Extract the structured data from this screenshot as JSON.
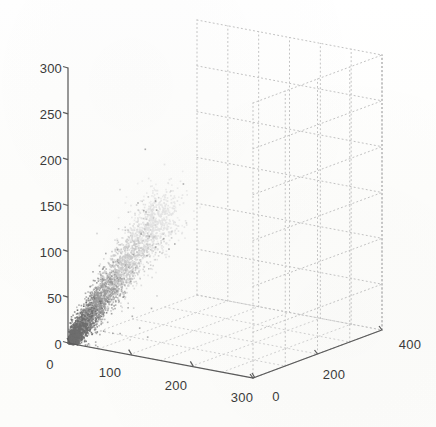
{
  "figure": {
    "kind": "matlab-3d-scatter",
    "background_color": "#fdfdfc",
    "axis_line_color": "#555555",
    "grid_color": "#b9b9b9",
    "tick_label_color": "#3a3a3a"
  },
  "chart_data": {
    "type": "scatter",
    "projection": "3d",
    "title": "",
    "xlabel": "",
    "ylabel": "",
    "zlabel": "",
    "grid": true,
    "legend": "none",
    "xlim": [
      0,
      300
    ],
    "ylim": [
      0,
      400
    ],
    "zlim": [
      0,
      300
    ],
    "xticks": [
      0,
      100,
      200,
      300
    ],
    "yticks": [
      0,
      200,
      400
    ],
    "zticks": [
      0,
      50,
      100,
      150,
      200,
      250,
      300
    ],
    "xtick_labels": [
      "0",
      "100",
      "200",
      "300"
    ],
    "ytick_labels": [
      "0",
      "200",
      "400"
    ],
    "ztick_labels": [
      "0",
      "50",
      "100",
      "150",
      "200",
      "250",
      "300"
    ],
    "marker": "point",
    "marker_size_px": 1.6,
    "colormap": "grayscale-dark-to-light",
    "series": [
      {
        "name": "cluster",
        "description": "Dense elongated point cloud rising from the origin along the x-z diagonal; dark gray near origin fading to very light gray at the upper extent. Y spread is narrow, concentrated near y=0.",
        "n_points": 4200,
        "x_range": [
          0,
          150
        ],
        "y_range": [
          0,
          60
        ],
        "z_range": [
          0,
          165
        ],
        "correlation_xz": 0.93,
        "centroid": [
          42,
          14,
          44
        ]
      }
    ],
    "point_colors": {
      "dark": "#6e6e6e",
      "mid": "#9a9a9a",
      "light": "#c9c9c9",
      "faint": "#e2e2e2"
    }
  },
  "axes": {
    "z": {
      "name": "z-axis",
      "ticks": [
        {
          "label": "300",
          "x": 44,
          "y": 68
        },
        {
          "label": "250",
          "x": 44,
          "y": 114
        },
        {
          "label": "200",
          "x": 44,
          "y": 160
        },
        {
          "label": "150",
          "x": 44,
          "y": 206
        },
        {
          "label": "100",
          "x": 44,
          "y": 252
        },
        {
          "label": "50",
          "x": 44,
          "y": 298
        },
        {
          "label": "0",
          "x": 44,
          "y": 344
        }
      ]
    },
    "x": {
      "name": "x-axis",
      "ticks": [
        {
          "label": "0",
          "x": 50,
          "y": 364
        },
        {
          "label": "100",
          "x": 108,
          "y": 371
        },
        {
          "label": "200",
          "x": 174,
          "y": 384
        },
        {
          "label": "300",
          "x": 240,
          "y": 396
        }
      ]
    },
    "y": {
      "name": "y-axis",
      "ticks": [
        {
          "label": "0",
          "x": 273,
          "y": 396
        },
        {
          "label": "200",
          "x": 330,
          "y": 374
        },
        {
          "label": "400",
          "x": 408,
          "y": 344
        }
      ]
    }
  }
}
